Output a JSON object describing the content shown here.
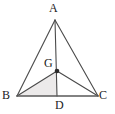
{
  "figure": {
    "name": "triangle-centroid-diagram",
    "background_color": "#ffffff",
    "stroke_color": "#4a4a4a",
    "base_stroke_color": "#5a5a5a",
    "shade_color": "#eceaea",
    "label_color": "#1a1a1a",
    "point_color": "#2b2b2b"
  },
  "labels": {
    "a": "A",
    "b": "B",
    "c": "C",
    "d": "D",
    "g": "G"
  },
  "points": {
    "A": {
      "x": 55,
      "y": 20
    },
    "B": {
      "x": 17,
      "y": 96
    },
    "C": {
      "x": 98,
      "y": 96
    },
    "D": {
      "x": 57,
      "y": 96
    },
    "G": {
      "x": 57,
      "y": 71
    }
  },
  "segments": [
    {
      "name": "side-AB",
      "from": "A",
      "to": "B"
    },
    {
      "name": "side-AC",
      "from": "A",
      "to": "C"
    },
    {
      "name": "side-BC",
      "from": "B",
      "to": "C"
    },
    {
      "name": "median-AD",
      "from": "A",
      "to": "D"
    },
    {
      "name": "segment-GB",
      "from": "G",
      "to": "B"
    },
    {
      "name": "segment-GC",
      "from": "G",
      "to": "C"
    }
  ],
  "shaded_region": {
    "name": "triangle-BGD",
    "vertices": [
      "B",
      "G",
      "D"
    ]
  },
  "marked_points": [
    {
      "name": "centroid-point-G",
      "at": "G",
      "radius": 2.3
    }
  ]
}
